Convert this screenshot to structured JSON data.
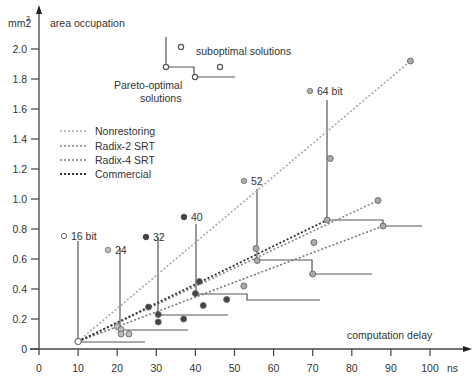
{
  "chart_data": {
    "type": "scatter",
    "title": "",
    "xlabel": "computation delay",
    "xunit": "ns",
    "ylabel": "area occupation",
    "yunit": "mm2",
    "xlim": [
      0,
      100
    ],
    "ylim": [
      0,
      2.0
    ],
    "xticks": [
      0,
      10,
      20,
      30,
      40,
      50,
      60,
      70,
      80,
      90,
      100
    ],
    "yticks": [
      0,
      0.2,
      0.4,
      0.6,
      0.8,
      1.0,
      1.2,
      1.4,
      1.6,
      1.8,
      2.0
    ],
    "ytick_labels": [
      "0",
      "0.2",
      "0.4",
      "0.6",
      "0.8",
      "1.0",
      "1.2",
      "1.4",
      "1.6",
      "1.8",
      "2.0"
    ],
    "grid": false,
    "legend": {
      "position": "upper-left",
      "entries": [
        {
          "label": "Nonrestoring",
          "color": "#a8a8a8"
        },
        {
          "label": "Radix-2 SRT",
          "color": "#888888"
        },
        {
          "label": "Radix-4 SRT",
          "color": "#777777"
        },
        {
          "label": "Commercial",
          "color": "#333333"
        }
      ]
    },
    "inset_legend": {
      "suboptimal_label": "suboptimal solutions",
      "pareto_label_line1": "Pareto-optimal",
      "pareto_label_line2": "solutions"
    },
    "bit_widths": [
      {
        "label": "16 bit",
        "color": "#ffffff"
      },
      {
        "label": "24",
        "color": "#bdbdbd"
      },
      {
        "label": "32",
        "color": "#444444"
      },
      {
        "label": "40",
        "color": "#444444"
      },
      {
        "label": "52",
        "color": "#aaaaaa"
      },
      {
        "label": "64 bit",
        "color": "#aaaaaa"
      }
    ],
    "series": [
      {
        "name": "Nonrestoring",
        "points": [
          [
            10,
            0.05
          ],
          [
            20,
            0.15
          ],
          [
            28,
            0.28
          ],
          [
            41,
            0.45
          ],
          [
            55.8,
            0.59
          ],
          [
            74.5,
            1.27
          ],
          [
            95,
            1.92
          ]
        ]
      },
      {
        "name": "Radix-2 SRT",
        "points": [
          [
            10,
            0.05
          ],
          [
            21,
            0.13
          ],
          [
            30.5,
            0.18
          ],
          [
            42,
            0.29
          ],
          [
            52.4,
            0.42
          ],
          [
            70.3,
            0.71
          ],
          [
            86.7,
            0.99
          ]
        ]
      },
      {
        "name": "Radix-4 SRT",
        "points": [
          [
            10,
            0.05
          ],
          [
            23,
            0.1
          ],
          [
            37,
            0.2
          ],
          [
            48,
            0.33
          ],
          [
            70,
            0.5
          ],
          [
            88,
            0.82
          ]
        ]
      },
      {
        "name": "Commercial",
        "points": [
          [
            10,
            0.05
          ],
          [
            21,
            0.1
          ],
          [
            30.5,
            0.23
          ],
          [
            40,
            0.37
          ],
          [
            55.5,
            0.67
          ],
          [
            73.7,
            0.86
          ]
        ]
      }
    ],
    "pareto_fronts": [
      {
        "bit": "16 bit",
        "x": 10,
        "y": 0.05
      },
      {
        "bit": "24",
        "x": 21,
        "y": 0.13
      },
      {
        "bit": "32",
        "x": 30.5,
        "y": 0.23
      },
      {
        "bit": "40",
        "x": 40,
        "y": 0.37
      },
      {
        "bit": "52",
        "x": 55.8,
        "y": 0.59
      },
      {
        "bit": "64 bit",
        "x": 73.7,
        "y": 0.86
      }
    ]
  }
}
